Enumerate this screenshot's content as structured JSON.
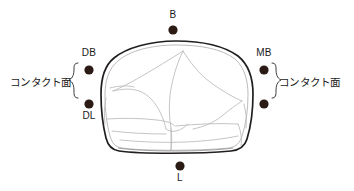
{
  "diagram": {
    "background_color": "#ffffff",
    "outline_color": "#231f20",
    "inner_line_color": "#b9b9b9",
    "marker_color": "#2b1b14",
    "text_color": "#1a1a1a",
    "markers": [
      {
        "id": "B",
        "label": "B",
        "cx": 173,
        "cy": 30,
        "r": 4.6,
        "label_position": "above"
      },
      {
        "id": "DB",
        "label": "DB",
        "cx": 89,
        "cy": 70,
        "r": 4.6,
        "label_position": "above"
      },
      {
        "id": "MB",
        "label": "MB",
        "cx": 264,
        "cy": 70,
        "r": 4.6,
        "label_position": "above"
      },
      {
        "id": "DL",
        "label": "DL",
        "cx": 89,
        "cy": 104,
        "r": 4.6,
        "label_position": "below"
      },
      {
        "id": "ML",
        "label": "",
        "cx": 264,
        "cy": 104,
        "r": 4.6,
        "label_position": "none"
      },
      {
        "id": "L",
        "label": "L",
        "cx": 180,
        "cy": 166,
        "r": 4.6,
        "label_position": "below"
      }
    ],
    "annotations": {
      "contact_left": "コンタクト面",
      "contact_right": "コンタクト面",
      "brace_left_direction": "left",
      "brace_right_direction": "right"
    },
    "labels": {
      "b": "B",
      "db": "DB",
      "mb": "MB",
      "dl": "DL",
      "l": "L"
    }
  }
}
